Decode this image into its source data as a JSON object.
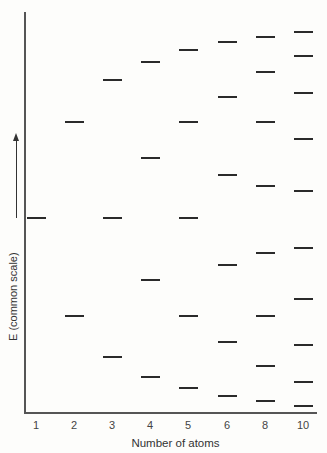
{
  "chart_data": {
    "type": "energy-level-diagram",
    "title": "",
    "xlabel": "Number of atoms",
    "ylabel": "E (common scale)",
    "categories": [
      "1",
      "2",
      "3",
      "4",
      "5",
      "6",
      "8",
      "10"
    ],
    "levels_px": {
      "1": [
        218
      ],
      "2": [
        122,
        316
      ],
      "3": [
        80,
        218,
        357
      ],
      "4": [
        62,
        158,
        280,
        377
      ],
      "5": [
        50,
        122,
        218,
        316,
        388
      ],
      "6": [
        42,
        97,
        175,
        265,
        342,
        396
      ],
      "8": [
        37,
        72,
        122,
        186,
        253,
        316,
        366,
        401
      ],
      "10": [
        32,
        56,
        93,
        139,
        191,
        248,
        299,
        345,
        382,
        406
      ]
    },
    "level_counts": [
      1,
      2,
      3,
      4,
      5,
      6,
      8,
      10
    ],
    "grid": false
  },
  "labels": {
    "xlabel": "Number of atoms",
    "ylabel": "E (common scale)",
    "ticks": [
      "1",
      "2",
      "3",
      "4",
      "5",
      "6",
      "8",
      "10"
    ]
  },
  "layout": {
    "column_x": [
      36,
      74,
      112,
      150,
      188,
      227,
      265,
      303
    ]
  }
}
